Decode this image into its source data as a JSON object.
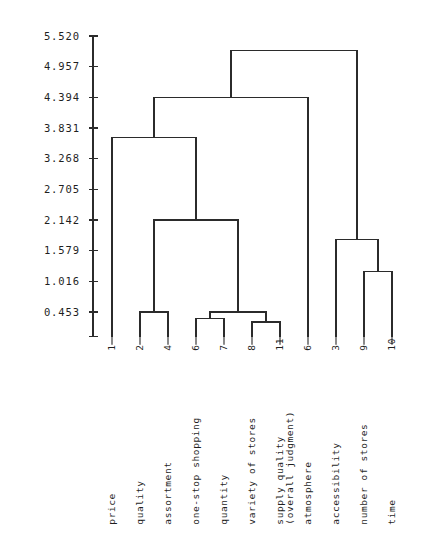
{
  "chart_data": {
    "type": "dendrogram",
    "title": "",
    "xlabel": "",
    "ylabel": "",
    "ylim": [
      0.0,
      5.52
    ],
    "grid": false,
    "legend": "none",
    "orientation": "vertical",
    "axis_ticks": [
      {
        "label": "5.520",
        "value": 5.52
      },
      {
        "label": "4.957",
        "value": 4.957
      },
      {
        "label": "4.394",
        "value": 4.394
      },
      {
        "label": "3.831",
        "value": 3.831
      },
      {
        "label": "3.268",
        "value": 3.268
      },
      {
        "label": "2.705",
        "value": 2.705
      },
      {
        "label": "2.142",
        "value": 2.142
      },
      {
        "label": "1.579",
        "value": 1.579
      },
      {
        "label": "1.016",
        "value": 1.016
      },
      {
        "label": "0.453",
        "value": 0.453
      }
    ],
    "leaves": [
      {
        "index": "1",
        "name": "price",
        "name2": "",
        "x": 112
      },
      {
        "index": "2",
        "name": "quality",
        "name2": "",
        "x": 140
      },
      {
        "index": "4",
        "name": "assortment",
        "name2": "",
        "x": 168
      },
      {
        "index": "6",
        "name": "one-stop shopping",
        "name2": "",
        "x": 196
      },
      {
        "index": "7",
        "name": "quantity",
        "name2": "",
        "x": 224
      },
      {
        "index": "8",
        "name": "variety of stores",
        "name2": "",
        "x": 252
      },
      {
        "index": "11",
        "name": "supply quality",
        "name2": "(overall judgment)",
        "x": 280
      },
      {
        "index": "6",
        "name": "atmosphere",
        "name2": "",
        "x": 308
      },
      {
        "index": "3",
        "name": "accessibility",
        "name2": "",
        "x": 336
      },
      {
        "index": "9",
        "name": "number of stores",
        "name2": "",
        "x": 364
      },
      {
        "index": "10",
        "name": "time",
        "name2": "",
        "x": 392
      }
    ],
    "merges": [
      {
        "id": "m_2_4",
        "left": "leaf:2",
        "right": "leaf:4",
        "height": 0.453
      },
      {
        "id": "m_6_7",
        "left": "leaf:6",
        "right": "leaf:7",
        "height": 0.33
      },
      {
        "id": "m_8_11",
        "left": "leaf:8",
        "right": "leaf:11",
        "height": 0.27
      },
      {
        "id": "m_67_811",
        "left": "m_6_7",
        "right": "m_8_11",
        "height": 0.453
      },
      {
        "id": "m_9_10",
        "left": "leaf:9",
        "right": "leaf:10",
        "height": 1.2
      },
      {
        "id": "m_3_910",
        "left": "leaf:3",
        "right": "m_9_10",
        "height": 1.78
      },
      {
        "id": "m_24_67811",
        "left": "m_2_4",
        "right": "m_67_811",
        "height": 2.142
      },
      {
        "id": "m_1_rest",
        "left": "leaf:1",
        "right": "m_24_67811",
        "height": 3.65
      },
      {
        "id": "m_left_atmos",
        "left": "m_1_rest",
        "right": "leaf:6b",
        "height": 4.394
      },
      {
        "id": "m_root",
        "left": "m_left_atmos",
        "right": "m_3_910",
        "height": 5.25
      }
    ]
  },
  "colors": {
    "line": "#2b2b2b",
    "text": "#1f1f1f",
    "background": "#ffffff"
  }
}
